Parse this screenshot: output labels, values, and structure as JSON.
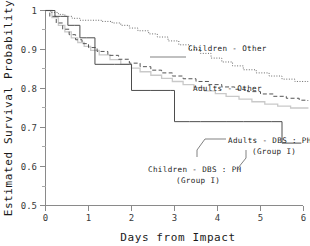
{
  "chart_data": {
    "type": "line",
    "title": "",
    "xlabel": "Days from Impact",
    "ylabel": "Estimated Survival Probability",
    "xlim": [
      0,
      6.3
    ],
    "ylim": [
      0.5,
      1.0
    ],
    "grid": false,
    "legend_position": "inline-annotations",
    "xticks": [
      "0",
      "1",
      "2",
      "3",
      "4",
      "5",
      "6"
    ],
    "xtick_values": [
      0,
      1,
      2,
      3,
      4,
      5,
      6
    ],
    "yticks": [
      "0.5",
      "0.6",
      "0.7",
      "0.8",
      "0.9",
      "1"
    ],
    "ytick_values": [
      0.5,
      0.6,
      0.7,
      0.8,
      0.9,
      1.0
    ],
    "yminor_values": [
      0.55,
      0.65,
      0.75,
      0.85,
      0.95
    ],
    "series": [
      {
        "name": "Children - Other",
        "style": "dotted",
        "color": "#6a6a6a",
        "x": [
          0,
          0.12,
          0.3,
          0.45,
          0.62,
          0.8,
          1.05,
          1.3,
          1.55,
          1.75,
          1.95,
          2.15,
          2.4,
          2.6,
          2.85,
          3.1,
          3.35,
          3.6,
          3.85,
          4.1,
          4.35,
          4.6,
          4.9,
          5.2,
          5.5,
          5.8,
          6.1
        ],
        "y": [
          1.0,
          0.995,
          0.99,
          0.985,
          0.98,
          0.975,
          0.975,
          0.972,
          0.968,
          0.962,
          0.955,
          0.948,
          0.94,
          0.932,
          0.922,
          0.912,
          0.9,
          0.89,
          0.878,
          0.868,
          0.858,
          0.848,
          0.84,
          0.832,
          0.824,
          0.818,
          0.815
        ]
      },
      {
        "name": "Adults - Other",
        "style": "dashed",
        "color": "#555555",
        "x": [
          0,
          0.1,
          0.25,
          0.4,
          0.55,
          0.7,
          0.85,
          1.0,
          1.2,
          1.45,
          1.7,
          1.95,
          2.2,
          2.45,
          2.7,
          2.95,
          3.2,
          3.5,
          3.8,
          4.1,
          4.4,
          4.7,
          5.0,
          5.3,
          5.6,
          5.9,
          6.1
        ],
        "y": [
          1.0,
          0.985,
          0.968,
          0.952,
          0.938,
          0.925,
          0.915,
          0.905,
          0.895,
          0.885,
          0.875,
          0.865,
          0.856,
          0.847,
          0.84,
          0.832,
          0.825,
          0.818,
          0.81,
          0.804,
          0.798,
          0.792,
          0.786,
          0.78,
          0.775,
          0.77,
          0.768
        ]
      },
      {
        "name": "Adults - DBS:PH (Group I)",
        "style": "light-solid",
        "color": "#c9c9c9",
        "x": [
          0,
          0.15,
          0.3,
          0.45,
          0.6,
          0.75,
          0.9,
          1.05,
          1.25,
          1.5,
          1.75,
          2.0,
          2.2,
          2.45,
          2.7,
          2.95,
          3.2,
          3.45,
          3.7,
          3.95,
          4.2,
          4.5,
          4.8,
          5.1,
          5.4,
          5.7,
          6.1
        ],
        "y": [
          1.0,
          0.982,
          0.962,
          0.945,
          0.93,
          0.918,
          0.908,
          0.898,
          0.886,
          0.874,
          0.862,
          0.852,
          0.843,
          0.834,
          0.826,
          0.818,
          0.81,
          0.802,
          0.794,
          0.787,
          0.78,
          0.773,
          0.766,
          0.76,
          0.755,
          0.75,
          0.748
        ]
      },
      {
        "name": "Children - DBS:PH (Group I)",
        "style": "solid-dark",
        "color": "#4d4d4d",
        "x": [
          0,
          0.08,
          0.22,
          0.35,
          0.52,
          0.68,
          0.8,
          0.95,
          1.15,
          1.6,
          1.95,
          2.0,
          2.45,
          2.9,
          3.0,
          3.35,
          3.6,
          4.2,
          4.6,
          5.25,
          5.5,
          5.95
        ],
        "y": [
          1.0,
          1.0,
          0.985,
          0.985,
          0.962,
          0.962,
          0.93,
          0.93,
          0.862,
          0.862,
          0.862,
          0.795,
          0.795,
          0.795,
          0.715,
          0.715,
          0.715,
          0.715,
          0.715,
          0.715,
          0.66,
          0.66
        ]
      }
    ],
    "annotations": [
      {
        "id": "children-other",
        "lines": [
          "Children  -  Other"
        ],
        "x": 188,
        "y": 52
      },
      {
        "id": "adults-other",
        "lines": [
          "Adults  -  Other"
        ],
        "x": 193,
        "y": 90
      },
      {
        "id": "adults-dbs-ph",
        "lines": [
          "Adults  -  DBS : PH",
          "(Group I)"
        ],
        "x": 228,
        "y": 143
      },
      {
        "id": "children-dbs-ph",
        "lines": [
          "Children  -  DBS : PH",
          "(Group I)"
        ],
        "x": 150,
        "y": 172
      }
    ]
  }
}
